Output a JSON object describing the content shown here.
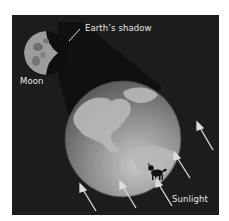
{
  "figure": {
    "labels": {
      "shadow": "Earth’s shadow",
      "moon": "Moon",
      "sunlight": "Sunlight"
    },
    "icons": [
      "moon-icon",
      "earth-icon",
      "dog-icon",
      "sunlight-arrow-icon"
    ],
    "colors": {
      "background": "#1c1c1c",
      "shadow_cone": "#0e0e0e",
      "earth_ocean": "#8a8a8a",
      "earth_land": "#b4b4b4",
      "moon": "#a8a8a8",
      "arrow": "#dcdcdc",
      "text": "#e8e8e8"
    },
    "sunlight_arrow_count": 5
  }
}
